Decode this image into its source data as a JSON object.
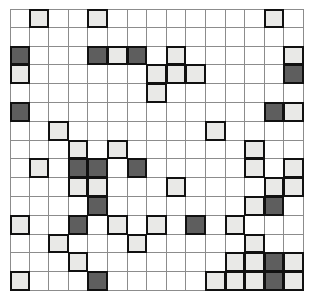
{
  "figure": {
    "title": "",
    "type": "binary-occupancy-grid",
    "rows": 15,
    "cols": 15,
    "cell_pitch_px": 19.6,
    "origin_px": [
      10,
      9
    ]
  },
  "colors": {
    "background": "#ffffff",
    "gridline": "#8c8c8c",
    "cell_border": "#111111",
    "light_fill": "#e9e9e7",
    "dark_fill": "#5e5e5e"
  },
  "legend": {
    "empty_label": "empty",
    "light_label": "light-marked",
    "dark_label": "dark-marked"
  },
  "chart_data": {
    "type": "heatmap",
    "title": "",
    "xlabel": "",
    "ylabel": "",
    "categories_x": [
      "0",
      "1",
      "2",
      "3",
      "4",
      "5",
      "6",
      "7",
      "8",
      "9",
      "10",
      "11",
      "12",
      "13",
      "14"
    ],
    "categories_y": [
      "0",
      "1",
      "2",
      "3",
      "4",
      "5",
      "6",
      "7",
      "8",
      "9",
      "10",
      "11",
      "12",
      "13",
      "14"
    ],
    "value_map": {
      "0": "empty",
      "1": "light",
      "2": "dark"
    },
    "grid": [
      [
        0,
        1,
        0,
        0,
        1,
        0,
        0,
        0,
        0,
        0,
        0,
        0,
        0,
        1,
        0
      ],
      [
        0,
        0,
        0,
        0,
        0,
        0,
        0,
        0,
        0,
        0,
        0,
        0,
        0,
        0,
        0
      ],
      [
        2,
        0,
        0,
        0,
        2,
        1,
        2,
        0,
        1,
        0,
        0,
        0,
        0,
        0,
        1
      ],
      [
        1,
        0,
        0,
        0,
        0,
        0,
        0,
        1,
        1,
        1,
        0,
        0,
        0,
        0,
        2
      ],
      [
        0,
        0,
        0,
        0,
        0,
        0,
        0,
        1,
        0,
        0,
        0,
        0,
        0,
        0,
        0
      ],
      [
        2,
        0,
        0,
        0,
        0,
        0,
        0,
        0,
        0,
        0,
        0,
        0,
        0,
        2,
        1
      ],
      [
        0,
        0,
        1,
        0,
        0,
        0,
        0,
        0,
        0,
        0,
        1,
        0,
        0,
        0,
        0
      ],
      [
        0,
        0,
        0,
        1,
        0,
        1,
        0,
        0,
        0,
        0,
        0,
        0,
        1,
        0,
        0
      ],
      [
        0,
        1,
        0,
        2,
        2,
        0,
        2,
        0,
        0,
        0,
        0,
        0,
        1,
        0,
        1
      ],
      [
        0,
        0,
        0,
        1,
        1,
        0,
        0,
        0,
        1,
        0,
        0,
        0,
        0,
        1,
        1
      ],
      [
        0,
        0,
        0,
        0,
        2,
        0,
        0,
        0,
        0,
        0,
        0,
        0,
        1,
        2,
        0
      ],
      [
        1,
        0,
        0,
        2,
        0,
        1,
        0,
        1,
        0,
        2,
        0,
        1,
        0,
        0,
        0
      ],
      [
        0,
        0,
        1,
        0,
        0,
        0,
        1,
        0,
        0,
        0,
        0,
        0,
        1,
        0,
        0
      ],
      [
        0,
        0,
        0,
        1,
        0,
        0,
        0,
        0,
        0,
        0,
        0,
        1,
        1,
        2,
        1
      ],
      [
        1,
        0,
        0,
        0,
        2,
        0,
        0,
        0,
        0,
        0,
        1,
        1,
        1,
        2,
        1
      ]
    ]
  }
}
